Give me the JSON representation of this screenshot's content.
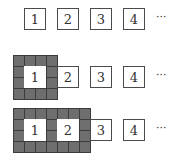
{
  "diagram": {
    "colors": {
      "cell_fill": "#6e6e6e",
      "cell_line": "#3c3c3c",
      "box_border": "#4a4a4a",
      "box_fill": "#ffffff"
    },
    "rows": [
      {
        "label_row": "row-1",
        "covered_boxes": 0,
        "grid": null,
        "boxes": [
          "1",
          "2",
          "3",
          "4"
        ],
        "ellipsis": "···"
      },
      {
        "label_row": "row-2",
        "covered_boxes": 1,
        "grid": {
          "cols": 4,
          "rows": 4
        },
        "boxes": [
          "1",
          "2",
          "3",
          "4"
        ],
        "ellipsis": "···"
      },
      {
        "label_row": "row-3",
        "covered_boxes": 2,
        "grid": {
          "cols": 7,
          "rows": 4
        },
        "boxes": [
          "1",
          "2",
          "3",
          "4"
        ],
        "ellipsis": "···"
      }
    ]
  }
}
